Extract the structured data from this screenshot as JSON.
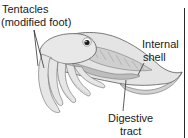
{
  "diagram": {
    "labels": {
      "tentacles": {
        "line1": "Tentacles",
        "line2": "(modified foot)"
      },
      "internal_shell": {
        "line1": "Internal",
        "line2": "shell"
      },
      "digestive_tract": {
        "line1": "Digestive",
        "line2": "tract"
      }
    },
    "colors": {
      "outline": "#5a5a5a",
      "body_fill": "#e4e4e4",
      "shade": "#bdbdbd",
      "text": "#1a1a1a",
      "eye": "#1c1c1c"
    }
  }
}
